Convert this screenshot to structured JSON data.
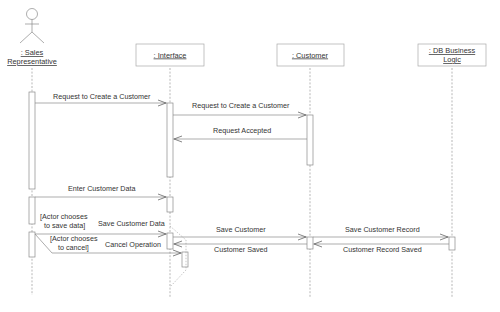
{
  "diagram": {
    "type": "uml-sequence",
    "lifelines": [
      {
        "id": "sales",
        "kind": "actor",
        "line1": ": Sales",
        "line2": "Representative",
        "x": 32
      },
      {
        "id": "interface",
        "kind": "object",
        "line1": ": Interface",
        "x": 170
      },
      {
        "id": "customer",
        "kind": "object",
        "line1": ": Customer",
        "x": 310
      },
      {
        "id": "db",
        "kind": "object",
        "line1": ": DB Business",
        "line2": "Logic",
        "x": 452
      }
    ],
    "messages": [
      {
        "from": "sales",
        "to": "interface",
        "label": "Request to Create a Customer",
        "type": "call"
      },
      {
        "from": "interface",
        "to": "customer",
        "label": "Request to Create a Customer",
        "type": "call"
      },
      {
        "from": "customer",
        "to": "interface",
        "label": "Request Accepted",
        "type": "return"
      },
      {
        "from": "sales",
        "to": "interface",
        "label": "Enter Customer Data",
        "type": "call"
      },
      {
        "from": "sales",
        "to": "interface",
        "label": "Save Customer Data",
        "type": "call",
        "guard": "[Actor chooses to save data]"
      },
      {
        "from": "interface",
        "to": "customer",
        "label": "Save Customer",
        "type": "call"
      },
      {
        "from": "customer",
        "to": "db",
        "label": "Save Customer Record",
        "type": "call"
      },
      {
        "from": "db",
        "to": "customer",
        "label": "Customer Record Saved",
        "type": "return"
      },
      {
        "from": "customer",
        "to": "interface",
        "label": "Customer Saved",
        "type": "return"
      },
      {
        "from": "sales",
        "to": "interface",
        "label": "Cancel Operation",
        "type": "call",
        "guard": "[Actor chooses to cancel]"
      }
    ],
    "guards": {
      "save": {
        "line1": "[Actor chooses",
        "line2": "to save data]"
      },
      "cancel": {
        "line1": "[Actor chooses",
        "line2": "to cancel]"
      }
    }
  }
}
